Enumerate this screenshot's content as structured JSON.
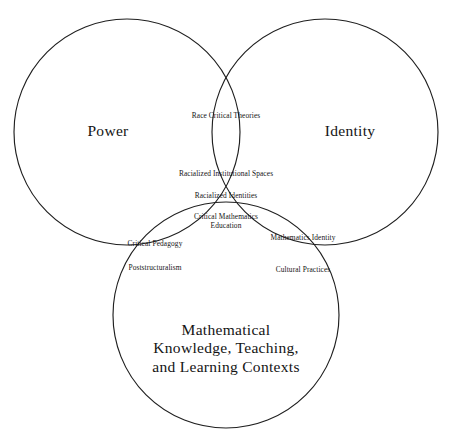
{
  "figure": {
    "type": "venn-diagram-3-set",
    "background_color": "#ffffff",
    "stroke_color": "#1f1f1f",
    "text_color": "#141414",
    "sets": [
      {
        "id": "power",
        "label": "Power"
      },
      {
        "id": "identity",
        "label": "Identity"
      },
      {
        "id": "math",
        "label_lines": [
          "Mathematical",
          "Knowledge, Teaching,",
          "and Learning Contexts"
        ]
      }
    ],
    "regions": {
      "power_identity": [
        {
          "text": "Race Critical Theories"
        }
      ],
      "power_identity_math": [
        {
          "text": "Racialized Institutional Spaces"
        },
        {
          "text": "Racialized Identities"
        },
        {
          "lines": [
            "Critical Mathematics",
            "Education"
          ]
        }
      ],
      "power_math": [
        {
          "text": "Critical Pedagogy"
        },
        {
          "text": "Poststructuralism"
        }
      ],
      "identity_math": [
        {
          "text": "Mathematics Identity"
        },
        {
          "text": "Cultural Practices"
        }
      ]
    }
  }
}
